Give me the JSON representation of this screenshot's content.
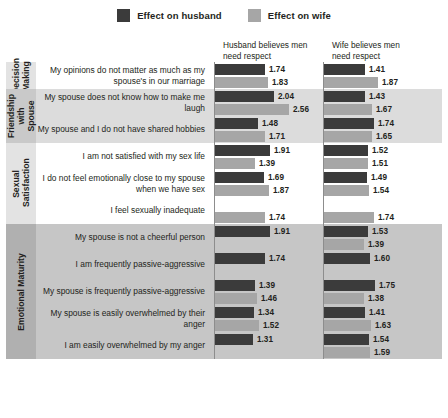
{
  "legend": {
    "items": [
      {
        "label": "Effect on husband",
        "color": "#3b3b3b",
        "key": "husband"
      },
      {
        "label": "Effect on wife",
        "color": "#a6a6a6",
        "key": "wife"
      }
    ]
  },
  "columns": [
    {
      "header_line1": "Husband believes men",
      "header_line2": "need respect"
    },
    {
      "header_line1": "Wife believes men",
      "header_line2": "need respect"
    }
  ],
  "chart_data": {
    "type": "bar",
    "orientation": "horizontal",
    "title": "",
    "xlabel": "",
    "ylabel": "",
    "xlim": [
      0,
      2.8
    ],
    "grid": false,
    "legend_position": "top-center",
    "series": [
      {
        "name": "Effect on husband",
        "color": "#3b3b3b"
      },
      {
        "name": "Effect on wife",
        "color": "#a6a6a6"
      }
    ],
    "panels": [
      "Husband believes men need respect",
      "Wife believes men need respect"
    ],
    "groups": [
      {
        "name": "Decision Making",
        "name_lines": [
          "Decision",
          "Making"
        ],
        "band": "#ffffff",
        "tab": "#e3e3e3",
        "rows": [
          {
            "label": "My opinions do not matter as much as my spouse's in our marriage",
            "panel1": {
              "husband": 1.74,
              "wife": 1.83
            },
            "panel2": {
              "husband": 1.41,
              "wife": 1.87
            }
          }
        ]
      },
      {
        "name": "Friendship with Spouse",
        "name_lines": [
          "Friendship",
          "with Spouse"
        ],
        "band": "#dcdcdc",
        "tab": "#c9c9c9",
        "rows": [
          {
            "label": "My spouse does not know how to make me laugh",
            "panel1": {
              "husband": 2.04,
              "wife": 2.56
            },
            "panel2": {
              "husband": 1.43,
              "wife": 1.67
            }
          },
          {
            "label": "My spouse and I do not have shared hobbies",
            "panel1": {
              "husband": 1.48,
              "wife": 1.71
            },
            "panel2": {
              "husband": 1.74,
              "wife": 1.65
            }
          }
        ]
      },
      {
        "name": "Sexual Satisfaction",
        "name_lines": [
          "Sexual",
          "Satisfaction"
        ],
        "band": "#ffffff",
        "tab": "#e3e3e3",
        "rows": [
          {
            "label": "I am not satisfied with my sex life",
            "panel1": {
              "husband": 1.91,
              "wife": 1.39
            },
            "panel2": {
              "husband": 1.52,
              "wife": 1.51
            }
          },
          {
            "label": "I do not feel emotionally close to my spouse when we have sex",
            "panel1": {
              "husband": 1.69,
              "wife": 1.87
            },
            "panel2": {
              "husband": 1.49,
              "wife": 1.54
            }
          },
          {
            "label": "I feel sexually inadequate",
            "panel1": {
              "husband": null,
              "wife": 1.74
            },
            "panel2": {
              "husband": null,
              "wife": 1.74
            }
          }
        ]
      },
      {
        "name": "Emotional Maturity",
        "name_lines": [
          "Emotional Maturity"
        ],
        "band": "#c6c6c6",
        "tab": "#b0b0b0",
        "rows": [
          {
            "label": "My spouse is not a cheerful person",
            "panel1": {
              "husband": 1.91,
              "wife": null
            },
            "panel2": {
              "husband": 1.53,
              "wife": 1.39
            }
          },
          {
            "label": "I am frequently passive-aggressive",
            "panel1": {
              "husband": 1.74,
              "wife": null
            },
            "panel2": {
              "husband": 1.6,
              "wife": null
            }
          },
          {
            "label": "My spouse is frequently passive-aggressive",
            "panel1": {
              "husband": 1.39,
              "wife": 1.46
            },
            "panel2": {
              "husband": 1.75,
              "wife": 1.38
            }
          },
          {
            "label": "My spouse is easily overwhelmed by their anger",
            "panel1": {
              "husband": 1.34,
              "wife": 1.52
            },
            "panel2": {
              "husband": 1.41,
              "wife": 1.63
            }
          },
          {
            "label": "I am easily overwhelmed by my anger",
            "panel1": {
              "husband": 1.31,
              "wife": null
            },
            "panel2": {
              "husband": 1.54,
              "wife": 1.59
            }
          }
        ]
      }
    ]
  }
}
